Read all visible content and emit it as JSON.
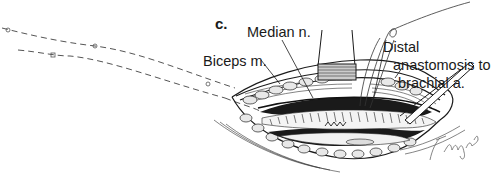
{
  "figure": {
    "panel_letter": "c.",
    "labels": {
      "median_nerve": "Median n.",
      "biceps": "Biceps m.",
      "distal_line1": "Distal",
      "distal_line2": "anastomosis to",
      "distal_line3": "brachial a."
    },
    "signature": "T.Hang-C",
    "colors": {
      "ink": "#1a1a1a",
      "background": "#ffffff",
      "dash": "#555555"
    }
  }
}
